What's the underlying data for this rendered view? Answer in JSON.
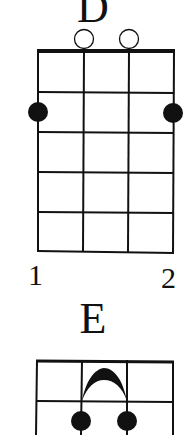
{
  "chords": [
    {
      "name": "D",
      "open_strings": [
        2,
        3
      ],
      "fingered": [
        {
          "string": 1,
          "fret": 2
        },
        {
          "string": 4,
          "fret": 2
        }
      ],
      "fret_labels": [
        "1",
        "2"
      ]
    },
    {
      "name": "E",
      "barre": {
        "from_string": 2,
        "to_string": 3,
        "fret": 1
      },
      "fingered": [
        {
          "string": 2,
          "fret": 2
        },
        {
          "string": 3,
          "fret": 2
        }
      ]
    }
  ],
  "colors": {
    "ink": "#111111",
    "background": "#ffffff"
  }
}
